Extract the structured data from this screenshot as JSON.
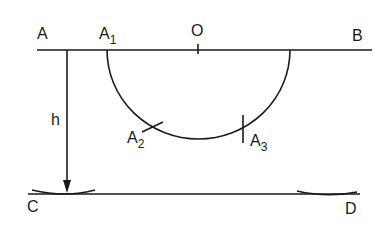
{
  "diagram": {
    "type": "geometric-construction",
    "points": {
      "A": {
        "label": "A"
      },
      "A1": {
        "label": "A",
        "sub": "1"
      },
      "O": {
        "label": "O"
      },
      "B": {
        "label": "B"
      },
      "A2": {
        "label": "A",
        "sub": "2"
      },
      "A3": {
        "label": "A",
        "sub": "3"
      },
      "C": {
        "label": "C"
      },
      "D": {
        "label": "D"
      }
    },
    "dimension": {
      "label": "h"
    },
    "stroke_color": "#1a1a1a"
  }
}
